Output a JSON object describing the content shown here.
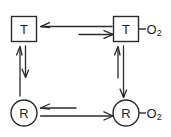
{
  "diagram": {
    "background_color": "#ffffff",
    "stroke_color": "#2b2b2b",
    "width": 171,
    "height": 137,
    "nodes": [
      {
        "id": "t-unbound",
        "label": "T",
        "shape": "square",
        "ligand": "",
        "ligand_subscript": ""
      },
      {
        "id": "t-bound",
        "label": "T",
        "shape": "square",
        "ligand": "O",
        "ligand_subscript": "2"
      },
      {
        "id": "r-unbound",
        "label": "R",
        "shape": "circle",
        "ligand": "",
        "ligand_subscript": ""
      },
      {
        "id": "r-bound",
        "label": "R",
        "shape": "circle",
        "ligand": "O",
        "ligand_subscript": "2"
      }
    ],
    "arrows": [
      {
        "id": "top-reverse",
        "direction": "left",
        "from": "t-bound",
        "to": "t-unbound"
      },
      {
        "id": "top-forward",
        "direction": "right",
        "from": "t-unbound",
        "to": "t-bound"
      },
      {
        "id": "left-up",
        "direction": "up",
        "from": "r-unbound",
        "to": "t-unbound"
      },
      {
        "id": "left-down",
        "direction": "down",
        "from": "t-unbound",
        "to": "r-unbound"
      },
      {
        "id": "right-up",
        "direction": "up",
        "from": "r-bound",
        "to": "t-bound"
      },
      {
        "id": "right-down",
        "direction": "down",
        "from": "t-bound",
        "to": "r-bound"
      },
      {
        "id": "bottom-reverse",
        "direction": "left",
        "from": "r-bound",
        "to": "r-unbound"
      },
      {
        "id": "bottom-forward",
        "direction": "right",
        "from": "r-unbound",
        "to": "r-bound"
      }
    ]
  }
}
